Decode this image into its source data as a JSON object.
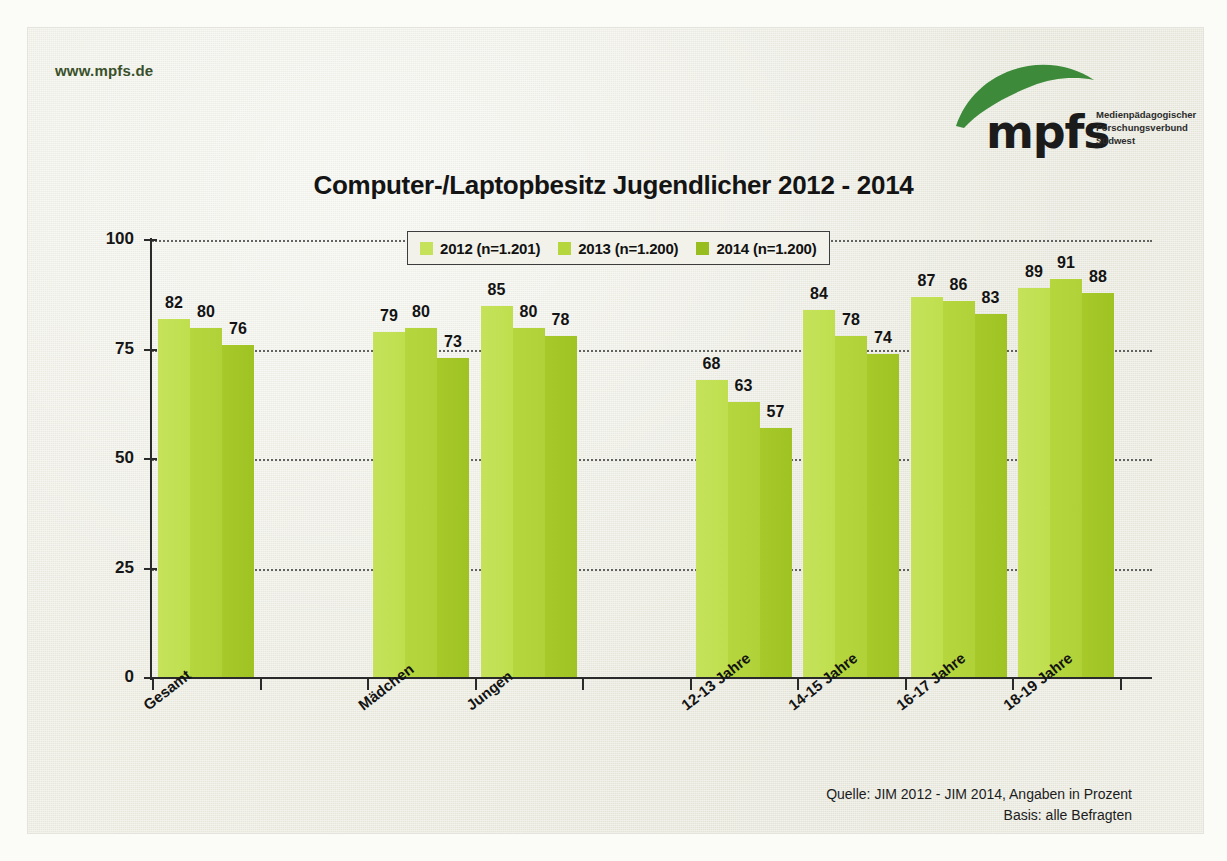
{
  "header": {
    "site_url": "www.mpfs.de",
    "logo": {
      "wordmark": "mpfs",
      "icon_name": "mpfs-swoosh-logo",
      "subtitle_lines": [
        "Medienpädagogischer",
        "Forschungsverbund",
        "Südwest"
      ],
      "color": "#3d8b3a"
    }
  },
  "footer": {
    "source_line_1": "Quelle: JIM 2012 - JIM 2014, Angaben in Prozent",
    "source_line_2": "Basis: alle Befragten"
  },
  "colors": {
    "series_2012": "#c5e25a",
    "series_2013": "#b6d63e",
    "series_2014": "#a0c324",
    "paper": "#ecece1",
    "axis": "#2a2a2a",
    "title": "#141414",
    "url": "#39502a"
  },
  "chart_data": {
    "type": "bar",
    "title": "Computer-/Laptopbesitz Jugendlicher 2012 - 2014",
    "xlabel": "",
    "ylabel": "",
    "ylim": [
      0,
      100
    ],
    "yticks": [
      0,
      25,
      50,
      75,
      100
    ],
    "ytick_labels": [
      "0",
      "25",
      "50",
      "75",
      "100"
    ],
    "grid": "horizontal-dotted",
    "legend_position": "top-center",
    "categories": [
      "Gesamt",
      "Mädchen",
      "Jungen",
      "12-13 Jahre",
      "14-15 Jahre",
      "16-17 Jahre",
      "18-19 Jahre"
    ],
    "series": [
      {
        "name": "2012 (n=1.201)",
        "year": "2012",
        "color": "#c5e25a",
        "values": [
          82,
          79,
          85,
          68,
          84,
          87,
          89
        ]
      },
      {
        "name": "2013 (n=1.200)",
        "year": "2013",
        "color": "#b6d63e",
        "values": [
          80,
          80,
          80,
          63,
          78,
          86,
          91
        ]
      },
      {
        "name": "2014 (n=1.200)",
        "year": "2014",
        "color": "#a0c324",
        "values": [
          76,
          73,
          78,
          57,
          74,
          83,
          88
        ]
      }
    ],
    "groups": [
      {
        "category": "Gesamt",
        "slot": 0,
        "values": [
          82,
          80,
          76
        ]
      },
      {
        "category": "Mädchen",
        "slot": 2,
        "values": [
          79,
          80,
          73
        ]
      },
      {
        "category": "Jungen",
        "slot": 3,
        "values": [
          85,
          80,
          78
        ]
      },
      {
        "category": "12-13 Jahre",
        "slot": 5,
        "values": [
          68,
          63,
          57
        ]
      },
      {
        "category": "14-15 Jahre",
        "slot": 6,
        "values": [
          84,
          78,
          74
        ]
      },
      {
        "category": "16-17 Jahre",
        "slot": 7,
        "values": [
          87,
          86,
          83
        ]
      },
      {
        "category": "18-19 Jahre",
        "slot": 8,
        "values": [
          89,
          91,
          88
        ]
      }
    ],
    "legend": [
      "2012 (n=1.201)",
      "2013 (n=1.200)",
      "2014 (n=1.200)"
    ]
  }
}
